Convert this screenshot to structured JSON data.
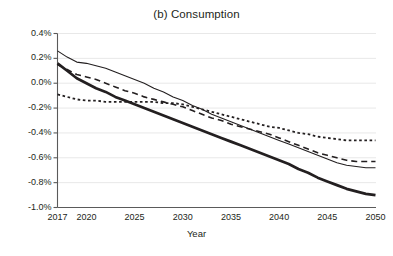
{
  "chart_data": {
    "type": "line",
    "title": "(b) Consumption",
    "xlabel": "Year",
    "ylabel": "",
    "xlim": [
      2017,
      2050
    ],
    "ylim": [
      -1.0,
      0.4
    ],
    "grid": true,
    "legend": "none",
    "y_tick_labels": [
      "0.4%",
      "0.2%",
      "0.0%",
      "-0.2%",
      "-0.4%",
      "-0.6%",
      "-0.8%",
      "-1.0%"
    ],
    "y_tick_values": [
      0.4,
      0.2,
      0.0,
      -0.2,
      -0.4,
      -0.6,
      -0.8,
      -1.0
    ],
    "x_tick_labels": [
      "2017",
      "2020",
      "2025",
      "2030",
      "2035",
      "2040",
      "2045",
      "2050"
    ],
    "x_tick_values": [
      2017,
      2020,
      2025,
      2030,
      2035,
      2040,
      2045,
      2050
    ],
    "x": [
      2017,
      2018,
      2019,
      2020,
      2021,
      2022,
      2023,
      2024,
      2025,
      2026,
      2027,
      2028,
      2029,
      2030,
      2031,
      2032,
      2033,
      2034,
      2035,
      2036,
      2037,
      2038,
      2039,
      2040,
      2041,
      2042,
      2043,
      2044,
      2045,
      2046,
      2047,
      2048,
      2049,
      2050
    ],
    "series": [
      {
        "name": "thin-solid",
        "style": "solid",
        "width": 1.1,
        "color": "#231f20",
        "values": [
          0.26,
          0.21,
          0.17,
          0.16,
          0.14,
          0.12,
          0.09,
          0.06,
          0.03,
          0.0,
          -0.04,
          -0.07,
          -0.11,
          -0.14,
          -0.18,
          -0.21,
          -0.25,
          -0.28,
          -0.31,
          -0.34,
          -0.37,
          -0.4,
          -0.43,
          -0.46,
          -0.49,
          -0.52,
          -0.55,
          -0.58,
          -0.61,
          -0.64,
          -0.66,
          -0.67,
          -0.68,
          -0.68
        ]
      },
      {
        "name": "dashed",
        "style": "dashed",
        "width": 1.6,
        "color": "#231f20",
        "values": [
          0.15,
          0.11,
          0.07,
          0.05,
          0.03,
          0.0,
          -0.03,
          -0.06,
          -0.08,
          -0.11,
          -0.13,
          -0.15,
          -0.17,
          -0.19,
          -0.22,
          -0.25,
          -0.28,
          -0.3,
          -0.33,
          -0.35,
          -0.37,
          -0.39,
          -0.41,
          -0.44,
          -0.47,
          -0.5,
          -0.53,
          -0.56,
          -0.58,
          -0.6,
          -0.62,
          -0.63,
          -0.63,
          -0.63
        ]
      },
      {
        "name": "dotted",
        "style": "dotted",
        "width": 1.8,
        "color": "#231f20",
        "values": [
          -0.09,
          -0.11,
          -0.13,
          -0.14,
          -0.14,
          -0.15,
          -0.15,
          -0.15,
          -0.15,
          -0.15,
          -0.15,
          -0.16,
          -0.16,
          -0.17,
          -0.19,
          -0.21,
          -0.23,
          -0.25,
          -0.27,
          -0.29,
          -0.31,
          -0.33,
          -0.35,
          -0.36,
          -0.38,
          -0.4,
          -0.41,
          -0.43,
          -0.44,
          -0.45,
          -0.46,
          -0.46,
          -0.46,
          -0.46
        ]
      },
      {
        "name": "thick-solid",
        "style": "solid",
        "width": 2.7,
        "color": "#231f20",
        "values": [
          0.16,
          0.1,
          0.04,
          0.0,
          -0.04,
          -0.07,
          -0.11,
          -0.14,
          -0.17,
          -0.2,
          -0.23,
          -0.26,
          -0.29,
          -0.32,
          -0.35,
          -0.38,
          -0.41,
          -0.44,
          -0.47,
          -0.5,
          -0.53,
          -0.56,
          -0.59,
          -0.62,
          -0.65,
          -0.69,
          -0.72,
          -0.76,
          -0.79,
          -0.82,
          -0.85,
          -0.87,
          -0.89,
          -0.9
        ]
      }
    ]
  },
  "axes": {
    "grid_color": "#e8e8e8",
    "axis_color": "#5a5a5a",
    "text_color": "#231f20"
  }
}
